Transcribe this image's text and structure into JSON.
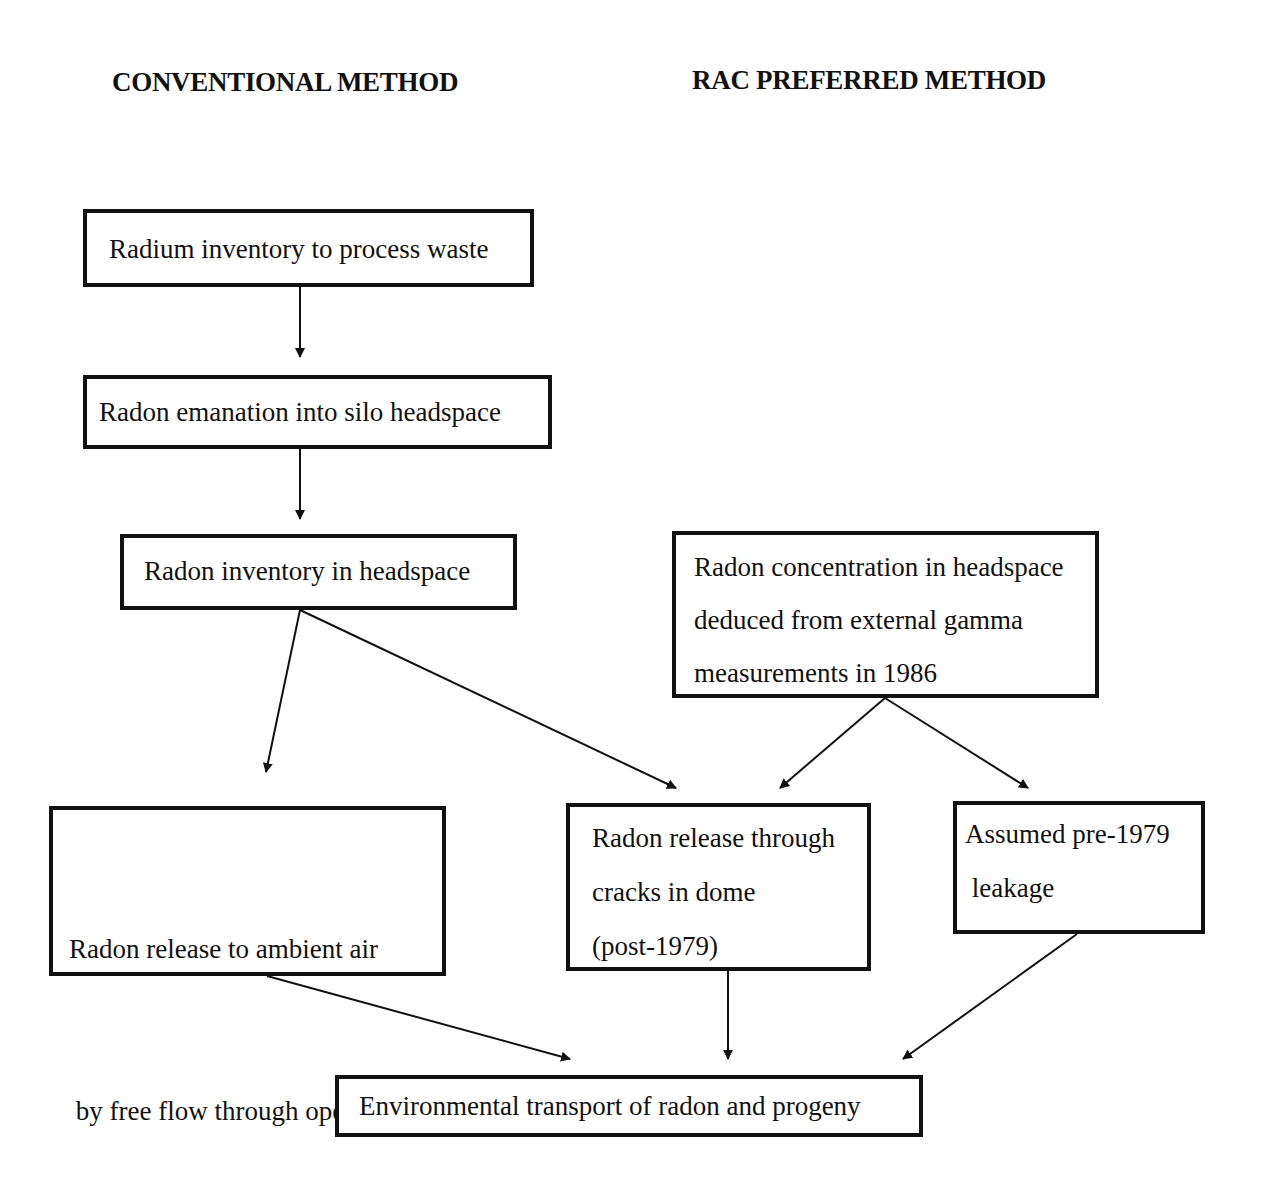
{
  "headings": {
    "left": "CONVENTIONAL METHOD",
    "right": "RAC PREFERRED METHOD"
  },
  "nodes": {
    "radium_inventory": {
      "lines": [
        "Radium inventory to process waste"
      ]
    },
    "radon_emanation": {
      "lines": [
        "Radon emanation into silo headspace"
      ]
    },
    "radon_inventory": {
      "lines": [
        "Radon inventory in headspace"
      ]
    },
    "radon_concentration": {
      "lines": [
        "Radon concentration in headspace",
        "deduced from external gamma",
        "measurements in 1986"
      ]
    },
    "release_ambient": {
      "lines": [
        "Radon release to ambient air",
        " by free flow through openings",
        "  (pre-1979)"
      ]
    },
    "release_cracks": {
      "lines": [
        "Radon release through",
        "cracks in dome",
        "(post-1979)"
      ]
    },
    "assumed_leakage": {
      "lines": [
        "Assumed pre-1979",
        " leakage"
      ]
    },
    "environmental_transport": {
      "lines": [
        "Environmental transport of radon and progeny"
      ]
    }
  },
  "edges": [
    {
      "from": "radium_inventory",
      "to": "radon_emanation"
    },
    {
      "from": "radon_emanation",
      "to": "radon_inventory"
    },
    {
      "from": "radon_inventory",
      "to": "release_ambient"
    },
    {
      "from": "radon_inventory",
      "to": "release_cracks"
    },
    {
      "from": "radon_concentration",
      "to": "release_cracks"
    },
    {
      "from": "radon_concentration",
      "to": "assumed_leakage"
    },
    {
      "from": "release_ambient",
      "to": "environmental_transport"
    },
    {
      "from": "release_cracks",
      "to": "environmental_transport"
    },
    {
      "from": "assumed_leakage",
      "to": "environmental_transport"
    }
  ]
}
